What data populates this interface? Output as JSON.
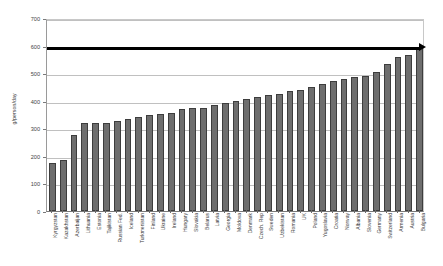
{
  "chart_data": {
    "type": "bar",
    "title": "",
    "subtitle": "",
    "xlabel": "",
    "ylabel": "g/person/day",
    "ylim": [
      0,
      700
    ],
    "ytick_step": 100,
    "yticks": [
      0,
      100,
      200,
      300,
      400,
      500,
      600,
      700
    ],
    "grid": true,
    "legend": false,
    "legend_position": "none",
    "bar_color": "#6e6e6e",
    "bar_edge_color": "#3d3d3d",
    "categories": [
      "Kyrgyzstan",
      "Kazakhstan",
      "Azerbaijan",
      "Lithuania",
      "Estonia",
      "Tajikistan",
      "Russian Fed.",
      "Iceland",
      "Turkmenistan",
      "Finland",
      "Ukraine",
      "Ireland",
      "Hungary",
      "Slovakia",
      "Belarus",
      "Latvia",
      "Georgia",
      "Moldova",
      "Denmark",
      "Czech. Rep",
      "Sweden",
      "Uzbekistan",
      "Romania",
      "UK",
      "Poland",
      "Yugoslavia",
      "Croatia",
      "Norway",
      "Albania",
      "Slovenia",
      "Germany",
      "Switzerland",
      "Armenia",
      "Austria",
      "Bulgaria"
    ],
    "values": [
      175,
      185,
      275,
      320,
      320,
      320,
      325,
      335,
      340,
      350,
      352,
      355,
      370,
      372,
      375,
      386,
      392,
      400,
      405,
      415,
      420,
      425,
      437,
      440,
      450,
      462,
      470,
      478,
      485,
      490,
      505,
      535,
      560,
      565,
      595
    ],
    "annotations": [
      {
        "name": "threshold-arrow",
        "type": "arrow-line",
        "value": 595,
        "color": "#000000",
        "label": ""
      }
    ]
  }
}
